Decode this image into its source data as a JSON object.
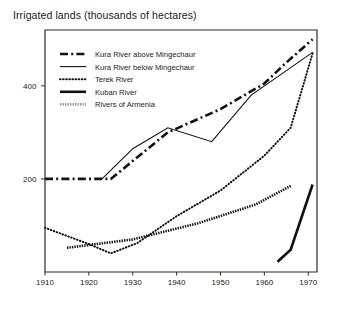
{
  "chart_data": {
    "type": "line",
    "title": "Irrigated lands (thousands of hectares)",
    "xlabel": "",
    "ylabel": "",
    "xlim": [
      1910,
      1972
    ],
    "ylim": [
      0,
      520
    ],
    "grid": false,
    "legend_position": "top-left-inside",
    "xticks": [
      1910,
      1920,
      1930,
      1940,
      1950,
      1960,
      1970
    ],
    "xtick_labels": [
      "1910",
      "1920",
      "1930",
      "1940",
      "1950",
      "1960",
      "1970"
    ],
    "yticks": [
      200,
      400
    ],
    "ytick_labels": [
      "200",
      "400"
    ],
    "series": [
      {
        "name": "Kura River above Mingechaur",
        "style": "dash-dot",
        "color": "#111111",
        "width": 2.6,
        "x": [
          1910,
          1925,
          1938,
          1950,
          1960,
          1965,
          1971
        ],
        "y": [
          200,
          200,
          300,
          350,
          405,
          450,
          500
        ]
      },
      {
        "name": "Kura River below Mingechaur",
        "style": "solid-thin",
        "color": "#111111",
        "width": 1.1,
        "x": [
          1923,
          1930,
          1938,
          1948,
          1957,
          1971
        ],
        "y": [
          200,
          265,
          310,
          280,
          380,
          472
        ]
      },
      {
        "name": "Terek River",
        "style": "dotted",
        "color": "#111111",
        "width": 2.0,
        "x": [
          1910,
          1920,
          1925,
          1931,
          1940,
          1950,
          1960,
          1966,
          1971
        ],
        "y": [
          95,
          60,
          40,
          62,
          120,
          175,
          250,
          310,
          470
        ]
      },
      {
        "name": "Kuban River",
        "style": "solid-thick",
        "color": "#111111",
        "width": 2.6,
        "x": [
          1963,
          1966,
          1971
        ],
        "y": [
          22,
          48,
          188
        ]
      },
      {
        "name": "Rivers of Armenia",
        "style": "hatched-gray",
        "color": "#9a9a9a",
        "width": 2.6,
        "x": [
          1915,
          1930,
          1945,
          1958,
          1966
        ],
        "y": [
          52,
          70,
          105,
          145,
          185
        ]
      }
    ],
    "legend_entries": [
      {
        "label": "Kura River above Mingechaur",
        "style": "dash-dot"
      },
      {
        "label": "Kura River below Mingechaur",
        "style": "solid-thin"
      },
      {
        "label": "Terek River",
        "style": "dotted"
      },
      {
        "label": "Kuban River",
        "style": "solid-thick"
      },
      {
        "label": "Rivers of Armenia",
        "style": "hatched-gray"
      }
    ]
  }
}
